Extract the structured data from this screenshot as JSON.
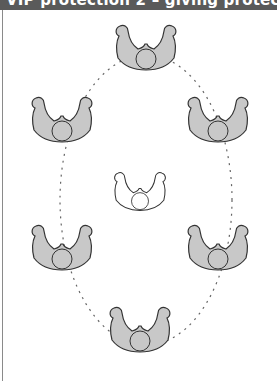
{
  "header": {
    "title": "VIP protection 2 – giving protection",
    "background": "#5a5a5a",
    "text_color": "#ffffff"
  },
  "diagram": {
    "formation": {
      "shape": "ellipse",
      "style": "dashed",
      "center": [
        146,
        200
      ],
      "rx": 86,
      "ry": 145
    },
    "figures": [
      {
        "role": "guard",
        "position": "top",
        "x": 146,
        "y": 58,
        "fill": "#c8c8c8"
      },
      {
        "role": "guard",
        "position": "upper-left",
        "x": 62,
        "y": 130,
        "fill": "#c8c8c8"
      },
      {
        "role": "guard",
        "position": "upper-right",
        "x": 218,
        "y": 130,
        "fill": "#c8c8c8"
      },
      {
        "role": "vip",
        "position": "center",
        "x": 140,
        "y": 200,
        "fill": "#ffffff"
      },
      {
        "role": "guard",
        "position": "lower-left",
        "x": 62,
        "y": 258,
        "fill": "#c8c8c8"
      },
      {
        "role": "guard",
        "position": "lower-right",
        "x": 218,
        "y": 258,
        "fill": "#c8c8c8"
      },
      {
        "role": "guard",
        "position": "bottom",
        "x": 140,
        "y": 340,
        "fill": "#c8c8c8"
      }
    ],
    "colors": {
      "guard_fill": "#c8c8c8",
      "vip_fill": "#ffffff",
      "outline": "#333333",
      "dash": "#666666"
    }
  }
}
